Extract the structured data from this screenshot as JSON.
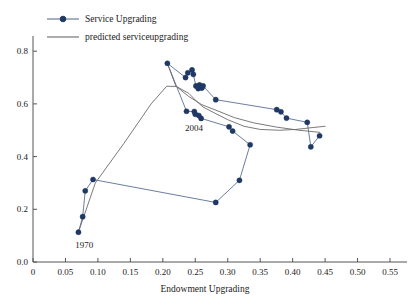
{
  "chart_data": {
    "type": "line",
    "title": "",
    "xlabel": "Endowment Upgrading",
    "ylabel": "",
    "xlim": [
      0,
      0.57
    ],
    "ylim": [
      0,
      0.85
    ],
    "grid": false,
    "legend_position": "top-left",
    "xticks": [
      "0",
      "0.05",
      "0.10",
      "0.15",
      "0.20",
      "0.25",
      "0.30",
      "0.35",
      "0.40",
      "0.45",
      "0.50",
      "0.55"
    ],
    "xtick_values": [
      0,
      0.05,
      0.1,
      0.15,
      0.2,
      0.25,
      0.3,
      0.35,
      0.4,
      0.45,
      0.5,
      0.55
    ],
    "yticks": [
      "0.0",
      "0.2",
      "0.4",
      "0.6",
      "0.8"
    ],
    "ytick_values": [
      0.0,
      0.2,
      0.4,
      0.6,
      0.8
    ],
    "series": [
      {
        "name": "Service Upgrading",
        "style": "line-marker",
        "color": "#1f3864",
        "line_color": "#5b6e95",
        "points": [
          [
            0.07,
            0.113
          ],
          [
            0.0765,
            0.172
          ],
          [
            0.0805,
            0.27
          ],
          [
            0.0925,
            0.313
          ],
          [
            0.2815,
            0.226
          ],
          [
            0.318,
            0.31
          ],
          [
            0.3345,
            0.445
          ],
          [
            0.3075,
            0.497
          ],
          [
            0.302,
            0.513
          ],
          [
            0.259,
            0.545
          ],
          [
            0.2555,
            0.556
          ],
          [
            0.25,
            0.561
          ],
          [
            0.2485,
            0.571
          ],
          [
            0.2365,
            0.572
          ],
          [
            0.207,
            0.754
          ],
          [
            0.235,
            0.7
          ],
          [
            0.2385,
            0.718
          ],
          [
            0.245,
            0.729
          ],
          [
            0.247,
            0.712
          ],
          [
            0.251,
            0.668
          ],
          [
            0.2545,
            0.658
          ],
          [
            0.2565,
            0.672
          ],
          [
            0.26,
            0.66
          ],
          [
            0.262,
            0.668
          ],
          [
            0.2815,
            0.616
          ],
          [
            0.3755,
            0.578
          ],
          [
            0.382,
            0.57
          ],
          [
            0.3905,
            0.546
          ],
          [
            0.4225,
            0.53
          ],
          [
            0.428,
            0.437
          ],
          [
            0.4415,
            0.479
          ]
        ]
      },
      {
        "name": "predicted serviceupgrading",
        "style": "line",
        "color": "#6b6b6b",
        "points": [
          [
            0.07,
            0.113
          ],
          [
            0.079,
            0.178
          ],
          [
            0.096,
            0.3
          ],
          [
            0.14,
            0.45
          ],
          [
            0.182,
            0.6
          ],
          [
            0.206,
            0.667
          ],
          [
            0.221,
            0.666
          ],
          [
            0.24,
            0.64
          ],
          [
            0.252,
            0.61
          ],
          [
            0.262,
            0.588
          ],
          [
            0.28,
            0.565
          ],
          [
            0.3,
            0.54
          ],
          [
            0.325,
            0.515
          ],
          [
            0.35,
            0.503
          ],
          [
            0.38,
            0.5
          ],
          [
            0.405,
            0.503
          ],
          [
            0.43,
            0.51
          ],
          [
            0.45,
            0.515
          ]
        ]
      },
      {
        "name": "predicted serviceupgrading lower",
        "style": "line",
        "color": "#6b6b6b",
        "points": [
          [
            0.207,
            0.754
          ],
          [
            0.22,
            0.668
          ],
          [
            0.24,
            0.628
          ],
          [
            0.26,
            0.597
          ],
          [
            0.285,
            0.573
          ],
          [
            0.31,
            0.548
          ],
          [
            0.34,
            0.528
          ],
          [
            0.375,
            0.512
          ],
          [
            0.41,
            0.5
          ],
          [
            0.442,
            0.492
          ]
        ]
      }
    ],
    "annotations": [
      {
        "text": "1970",
        "x": 0.079,
        "y": 0.055
      },
      {
        "text": "2004",
        "x": 0.248,
        "y": 0.498
      }
    ]
  },
  "legend": {
    "items": [
      {
        "label": "Service Upgrading",
        "marker": "circle-line",
        "color": "#1f3864"
      },
      {
        "label": "predicted serviceupgrading",
        "marker": "line",
        "color": "#6b6b6b"
      }
    ]
  },
  "axes": {
    "x_title": "Endowment Upgrading",
    "y_title": ""
  }
}
